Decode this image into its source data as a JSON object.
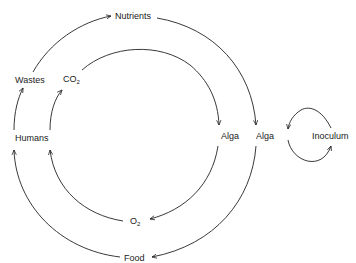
{
  "diagram": {
    "type": "cycle-diagram",
    "nodes": {
      "nutrients": "Nutrients",
      "wastes": "Wastes",
      "co2_main": "CO",
      "co2_sub": "2",
      "humans": "Humans",
      "alga_inner": "Alga",
      "alga_outer": "Alga",
      "inoculum": "Inoculum",
      "o2_main": "O",
      "o2_sub": "2",
      "food": "Food"
    },
    "edges": [
      {
        "from": "Humans",
        "to": "Wastes",
        "cycle": "outer"
      },
      {
        "from": "Wastes",
        "to": "Nutrients",
        "cycle": "outer"
      },
      {
        "from": "Nutrients",
        "to": "Alga",
        "cycle": "outer"
      },
      {
        "from": "Alga",
        "to": "Food",
        "cycle": "outer"
      },
      {
        "from": "Food",
        "to": "Humans",
        "cycle": "outer"
      },
      {
        "from": "Humans",
        "to": "CO2",
        "cycle": "inner"
      },
      {
        "from": "CO2",
        "to": "Alga",
        "cycle": "inner"
      },
      {
        "from": "Alga",
        "to": "O2",
        "cycle": "inner"
      },
      {
        "from": "O2",
        "to": "Humans",
        "cycle": "inner"
      },
      {
        "from": "Inoculum",
        "to": "Alga",
        "cycle": "inoculum-loop"
      },
      {
        "from": "Alga",
        "to": "Inoculum",
        "cycle": "inoculum-loop"
      }
    ],
    "colors": {
      "line": "#222222",
      "background": "#ffffff"
    }
  }
}
